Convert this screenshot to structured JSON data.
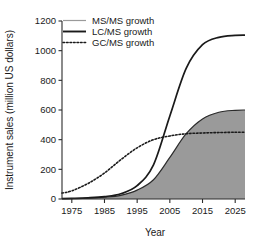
{
  "chart_data": {
    "type": "area",
    "title": "",
    "xlabel": "Year",
    "ylabel": "Instrument sales (million US dollars)",
    "xlim": [
      1972,
      2028
    ],
    "ylim": [
      0,
      1200
    ],
    "xticks": [
      "1975",
      "1985",
      "1995",
      "2005",
      "2015",
      "2025"
    ],
    "xtick_values": [
      1975,
      1985,
      1995,
      2005,
      2015,
      2025
    ],
    "yticks": [
      "0",
      "200",
      "400",
      "600",
      "800",
      "1000",
      "1200"
    ],
    "ytick_values": [
      0,
      200,
      400,
      600,
      800,
      1000,
      1200
    ],
    "grid": false,
    "legend_position": "top-left",
    "x": [
      1972,
      1975,
      1980,
      1985,
      1990,
      1995,
      2000,
      2005,
      2010,
      2015,
      2020,
      2025,
      2028
    ],
    "series": [
      {
        "name": "MS/MS growth",
        "label": "MS/MS growth",
        "style": "filled-area",
        "line_style": "solid",
        "line_color": "#8c8c8c",
        "fill_color": "#9a9a9a",
        "values": [
          2,
          3,
          6,
          12,
          25,
          60,
          130,
          280,
          440,
          540,
          585,
          598,
          600
        ]
      },
      {
        "name": "LC/MS growth",
        "label": "LC/MS growth",
        "style": "line",
        "line_style": "solid",
        "line_color": "#1a1a1a",
        "values": [
          2,
          4,
          8,
          16,
          35,
          90,
          230,
          560,
          880,
          1040,
          1090,
          1103,
          1105
        ]
      },
      {
        "name": "GC/MS growth",
        "label": "GC/MS growth",
        "style": "line",
        "line_style": "dotted",
        "line_color": "#1a1a1a",
        "values": [
          40,
          55,
          105,
          175,
          265,
          345,
          400,
          425,
          440,
          445,
          448,
          450,
          450
        ]
      }
    ]
  },
  "axes": {
    "y_title": "Instrument sales (million US dollars)",
    "x_title": "Year"
  },
  "legend": {
    "items": [
      {
        "label": "MS/MS growth",
        "swatch": "thin-gray-line-swatch"
      },
      {
        "label": "LC/MS growth",
        "swatch": "thick-black-line-swatch"
      },
      {
        "label": "GC/MS growth",
        "swatch": "dotted-line-swatch"
      }
    ]
  },
  "colors": {
    "area_fill": "#9a9a9a",
    "area_edge": "#8c8c8c",
    "primary_line": "#1a1a1a",
    "axis": "#2b2b2b",
    "background": "#ffffff"
  }
}
